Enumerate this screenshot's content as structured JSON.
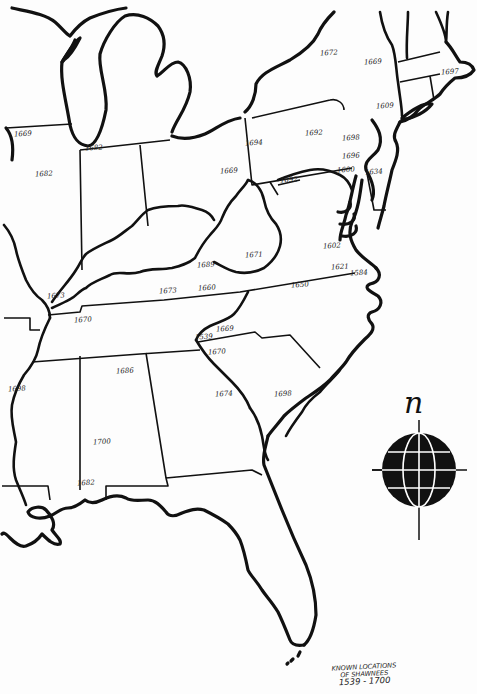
{
  "map": {
    "title_lines": [
      "KNOWN LOCATIONS",
      "OF SHAWNEES"
    ],
    "date_range": "1539 - 1700",
    "compass": {
      "north_label": "n",
      "icon": "globe-compass-rose"
    },
    "colors": {
      "ink": "#111111",
      "paper": "#fdfdfd"
    },
    "year_labels": [
      {
        "text": "1669",
        "x": 22,
        "y": 135,
        "region": "illinois-north"
      },
      {
        "text": "1682",
        "x": 43,
        "y": 175,
        "region": "illinois"
      },
      {
        "text": "1682",
        "x": 93,
        "y": 149,
        "region": "indiana-north"
      },
      {
        "text": "1669",
        "x": 228,
        "y": 172,
        "region": "ohio-east"
      },
      {
        "text": "1672",
        "x": 328,
        "y": 54,
        "region": "new-york"
      },
      {
        "text": "1669",
        "x": 372,
        "y": 63,
        "region": "new-york-east"
      },
      {
        "text": "1697",
        "x": 449,
        "y": 73,
        "region": "massachusetts"
      },
      {
        "text": "1694",
        "x": 253,
        "y": 144,
        "region": "pennsylvania-west"
      },
      {
        "text": "1692",
        "x": 313,
        "y": 134,
        "region": "pennsylvania"
      },
      {
        "text": "1698",
        "x": 350,
        "y": 139,
        "region": "pennsylvania-east"
      },
      {
        "text": "1609",
        "x": 384,
        "y": 107,
        "region": "new-york-harbor"
      },
      {
        "text": "1696",
        "x": 350,
        "y": 157,
        "region": "pennsylvania-southeast"
      },
      {
        "text": "1600",
        "x": 345,
        "y": 171,
        "region": "maryland-north"
      },
      {
        "text": "1634",
        "x": 373,
        "y": 173,
        "region": "delaware"
      },
      {
        "text": "1692",
        "x": 288,
        "y": 181,
        "region": "maryland-west"
      },
      {
        "text": "1671",
        "x": 253,
        "y": 256,
        "region": "west-virginia-south"
      },
      {
        "text": "1689",
        "x": 205,
        "y": 266,
        "region": "virginia-southwest"
      },
      {
        "text": "1602",
        "x": 331,
        "y": 247,
        "region": "chesapeake"
      },
      {
        "text": "1621",
        "x": 339,
        "y": 268,
        "region": "virginia-tidewater"
      },
      {
        "text": "1584",
        "x": 358,
        "y": 274,
        "region": "roanoke"
      },
      {
        "text": "1650",
        "x": 299,
        "y": 286,
        "region": "north-carolina-north"
      },
      {
        "text": "1660",
        "x": 206,
        "y": 289,
        "region": "virginia-tennessee-border"
      },
      {
        "text": "1673",
        "x": 167,
        "y": 292,
        "region": "kentucky-south"
      },
      {
        "text": "1673",
        "x": 55,
        "y": 297,
        "region": "kentucky-west"
      },
      {
        "text": "1670",
        "x": 82,
        "y": 321,
        "region": "tennessee"
      },
      {
        "text": "1669",
        "x": 224,
        "y": 330,
        "region": "north-carolina-west"
      },
      {
        "text": "1539",
        "x": 203,
        "y": 338,
        "region": "north-carolina-southwest"
      },
      {
        "text": "1670",
        "x": 216,
        "y": 353,
        "region": "georgia-north"
      },
      {
        "text": "1686",
        "x": 124,
        "y": 372,
        "region": "alabama-north"
      },
      {
        "text": "1698",
        "x": 16,
        "y": 390,
        "region": "mississippi"
      },
      {
        "text": "1674",
        "x": 223,
        "y": 395,
        "region": "georgia"
      },
      {
        "text": "1698",
        "x": 282,
        "y": 395,
        "region": "south-carolina"
      },
      {
        "text": "1700",
        "x": 101,
        "y": 443,
        "region": "alabama"
      },
      {
        "text": "1682",
        "x": 85,
        "y": 484,
        "region": "alabama-gulf"
      }
    ]
  }
}
